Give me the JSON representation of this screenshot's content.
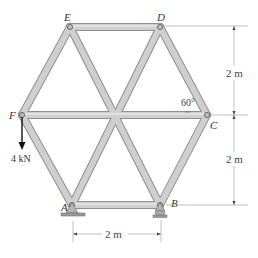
{
  "diagram": {
    "type": "hexagonal-truss",
    "joints": [
      {
        "id": "E",
        "label": "E",
        "x": 70,
        "y": 27
      },
      {
        "id": "D",
        "label": "D",
        "x": 160,
        "y": 27
      },
      {
        "id": "F",
        "label": "F",
        "x": 22,
        "y": 115
      },
      {
        "id": "C",
        "label": "C",
        "x": 207,
        "y": 115
      },
      {
        "id": "A",
        "label": "A",
        "x": 72,
        "y": 205
      },
      {
        "id": "B",
        "label": "B",
        "x": 160,
        "y": 205
      }
    ],
    "members": [
      "ED",
      "FE",
      "DC",
      "FC",
      "FA",
      "CB",
      "AB",
      "EB",
      "DA"
    ],
    "supports": [
      {
        "joint": "A",
        "type": "pin"
      },
      {
        "joint": "B",
        "type": "roller"
      }
    ],
    "load": {
      "joint": "F",
      "magnitude": "4 kN",
      "direction": "down"
    },
    "angle": {
      "value": "60°",
      "at": "C"
    },
    "dimensions": {
      "upper_height": "2 m",
      "lower_height": "2 m",
      "base_width": "2 m"
    },
    "colors": {
      "member_fill": "#c9c9c9",
      "member_edge": "#8f8f8f",
      "text": "#333333",
      "dim_line": "#888888"
    }
  }
}
